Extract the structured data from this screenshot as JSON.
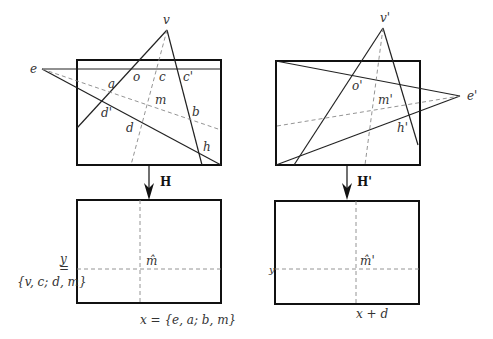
{
  "left_view": {
    "vertex_v": "v",
    "vertex_e": "e",
    "points": {
      "a": "a",
      "o": "o",
      "c": "c",
      "c_prime": "c'",
      "m": "m",
      "b": "b",
      "d_prime": "d'",
      "d": "d",
      "h": "h"
    },
    "transform": "H"
  },
  "right_view": {
    "vertex_v": "v'",
    "vertex_e": "e'",
    "points": {
      "o_prime": "o'",
      "m_prime": "m'",
      "h_prime": "h'"
    },
    "transform": "H'"
  },
  "left_rectified": {
    "center": "m̂",
    "y_label": "y",
    "y_eq": "=",
    "y_set": "{v, c; d, m}",
    "x_label": "x = {e, a; b, m}"
  },
  "right_rectified": {
    "center": "m̂'",
    "y_label": "y",
    "x_label": "x + d"
  }
}
